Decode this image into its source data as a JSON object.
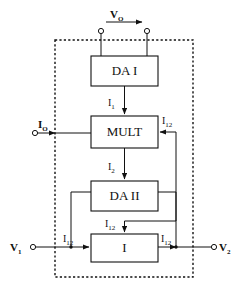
{
  "figure": {
    "type": "block-diagram",
    "title": ""
  },
  "blocks": [
    {
      "id": "da1",
      "label": "DA I",
      "x": 91,
      "y": 56,
      "w": 67,
      "h": 30
    },
    {
      "id": "mult",
      "label": "MULT",
      "x": 91,
      "y": 116,
      "w": 67,
      "h": 32
    },
    {
      "id": "da2",
      "label": "DA II",
      "x": 91,
      "y": 181,
      "w": 67,
      "h": 30
    },
    {
      "id": "i",
      "label": "I",
      "x": 91,
      "y": 234,
      "w": 67,
      "h": 28
    }
  ],
  "terminals": [
    {
      "id": "vo-left",
      "label": "",
      "sub": "",
      "x": 101,
      "y": 31
    },
    {
      "id": "vo-right",
      "label": "",
      "sub": "",
      "x": 147,
      "y": 31
    },
    {
      "id": "io",
      "label": "I",
      "sub": "O",
      "x": 35,
      "y": 133
    },
    {
      "id": "v1",
      "label": "V",
      "sub": "1",
      "x": 33,
      "y": 247
    },
    {
      "id": "v2",
      "label": "V",
      "sub": "2",
      "x": 214,
      "y": 247
    }
  ],
  "labels": {
    "vo": {
      "base": "V",
      "sub": "O",
      "x": 116,
      "y": 18
    },
    "io": {
      "base": "I",
      "sub": "O",
      "x": 43,
      "y": 123
    },
    "v1": {
      "base": "V",
      "sub": "1",
      "x": 14,
      "y": 250
    },
    "v2": {
      "base": "V",
      "sub": "2",
      "x": 220,
      "y": 250
    },
    "i1": {
      "base": "I",
      "sub": "1",
      "x": 109,
      "y": 103
    },
    "i2": {
      "base": "I",
      "sub": "2",
      "x": 109,
      "y": 167
    },
    "i12_mult": {
      "base": "I",
      "sub": "12",
      "x": 165,
      "y": 125
    },
    "i12_top_i": {
      "base": "I",
      "sub": "12",
      "x": 112,
      "y": 227
    },
    "i12_left": {
      "base": "I",
      "sub": "12",
      "x": 69,
      "y": 240
    },
    "i12_right": {
      "base": "I",
      "sub": "12",
      "x": 164,
      "y": 240
    }
  },
  "boundary": {
    "name": "dashed-enclosure",
    "x": 55,
    "y": 40,
    "w": 138,
    "h": 237
  },
  "colors": {
    "line": "#111111",
    "background": "#ffffff",
    "label": "#111111"
  }
}
